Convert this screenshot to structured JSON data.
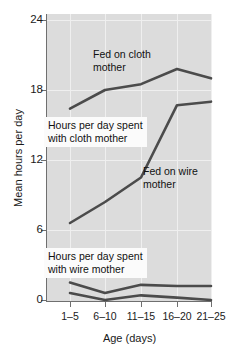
{
  "chart_data": {
    "type": "line",
    "title": "",
    "xlabel": "Age (days)",
    "ylabel": "Mean hours per day",
    "categories": [
      "1–5",
      "6–10",
      "11–15",
      "16–20",
      "21–25"
    ],
    "ylim": [
      0,
      25.2
    ],
    "yticks": [
      0,
      6,
      12,
      18,
      24
    ],
    "ytick_labels": [
      "0",
      "6",
      "12",
      "18",
      "24"
    ],
    "grid": true,
    "legend_position": "inline-annotations",
    "series": [
      {
        "name": "Fed on cloth mother",
        "values": [
          16.4,
          18.0,
          18.5,
          19.8,
          19.0
        ]
      },
      {
        "name": "Fed on wire mother",
        "values": [
          6.6,
          8.4,
          10.5,
          16.7,
          17.0
        ]
      },
      {
        "name": "Hours per day spent with cloth mother (wire-fed)",
        "values": [
          1.5,
          0.6,
          1.3,
          1.2,
          1.2
        ]
      },
      {
        "name": "Hours per day spent with wire mother",
        "values": [
          0.6,
          0.0,
          0.4,
          0.2,
          0.0
        ]
      }
    ],
    "annotations": [
      {
        "id": "fed-cloth",
        "text": "Fed on cloth\nmother",
        "boxed": false
      },
      {
        "id": "hours-cloth",
        "text": "Hours per day spent\nwith cloth mother",
        "boxed": true
      },
      {
        "id": "fed-wire",
        "text": "Fed on wire\nmother",
        "boxed": false
      },
      {
        "id": "hours-wire",
        "text": "Hours per day spent\nwith wire mother",
        "boxed": true
      }
    ]
  },
  "axes": {
    "y": {
      "title": "Mean hours per day",
      "ticks": [
        "24",
        "18",
        "12",
        "6",
        "0"
      ]
    },
    "x": {
      "title": "Age (days)",
      "ticks": [
        "1–5",
        "6–10",
        "11–15",
        "16–20",
        "21–25"
      ]
    }
  },
  "annotations": {
    "fed_cloth_mother": "Fed on cloth\nmother",
    "hours_cloth_mother": "Hours per day spent\nwith cloth mother",
    "fed_wire_mother": "Fed on wire\nmother",
    "hours_wire_mother": "Hours per day spent\nwith wire mother"
  },
  "colors": {
    "plot_background": "#dcdcdc",
    "gridline": "#efefef",
    "series_line": "#4b4b4b",
    "axis": "#6f6f6f",
    "text": "#111111",
    "annotation_box": "#fbfbfb"
  }
}
